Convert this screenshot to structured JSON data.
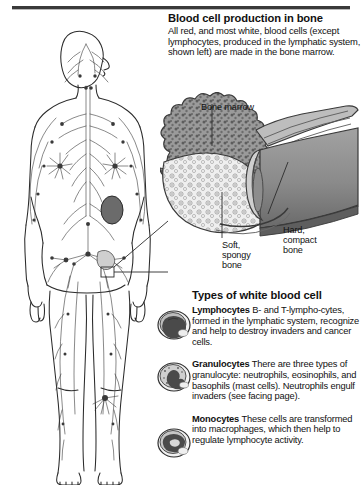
{
  "page": {
    "title": "Blood cell production in bone",
    "background_color": "#ffffff",
    "text_color": "#111111"
  },
  "header": {
    "title": "Blood cell production in bone",
    "body": "All red, and most white, blood cells (except lymphocytes, produced in the lymphatic system, shown left) are made in the bone marrow."
  },
  "figure": {
    "name": "lymphatic-system-body-diagram",
    "spleen_color": "#6b6b6b",
    "line_color": "#2b2b2b"
  },
  "bone_diagram": {
    "name": "cutaway-long-bone",
    "labels": {
      "marrow": "Bone marrow",
      "spongy": "Soft,\nspongy\nbone",
      "spongy_line1": "Soft,",
      "spongy_line2": "spongy",
      "spongy_line3": "bone",
      "compact_line1": "Hard,",
      "compact_line2": "compact",
      "compact_line3": "bone"
    },
    "colors": {
      "marrow": "#8b8b8b",
      "spongy": "#e8e8e8",
      "compact": "#8f8f8f",
      "compact_dark": "#6e6e6e"
    }
  },
  "white_blood_cells": {
    "title": "Types of white blood cell",
    "items": [
      {
        "name": "Lymphocytes",
        "term": "Lymphocytes",
        "text": "B- and T-lympho-cytes, formed in the lymphatic system, recognize and help to destroy invaders and cancer cells.",
        "icon": "lymphocyte-cell-icon"
      },
      {
        "name": "Granulocytes",
        "term": "Granulocytes",
        "text": "There are three types of granulocyte: neutrophils, eosinophils, and basophils (mast cells). Neutrophils engulf invaders (see facing page).",
        "icon": "granulocyte-cell-icon"
      },
      {
        "name": "Monocytes",
        "term": "Monocytes",
        "text": "These cells are transformed into macrophages, which then help to regulate lymphocyte activity.",
        "icon": "monocyte-cell-icon"
      }
    ]
  }
}
